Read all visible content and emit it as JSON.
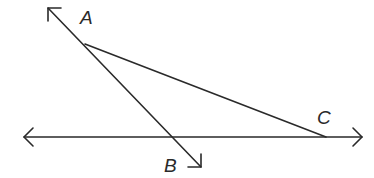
{
  "diagram": {
    "type": "geometry",
    "stroke_color": "#2a2a2a",
    "labels": {
      "A": "A",
      "B": "B",
      "C": "C"
    },
    "points": {
      "A": {
        "x": 85,
        "y": 44
      },
      "C": {
        "x": 326,
        "y": 137
      },
      "intersection": {
        "x": 172,
        "y": 137
      }
    },
    "lines": [
      {
        "name": "line-AB",
        "from": {
          "x": 48,
          "y": 8
        },
        "to": {
          "x": 201,
          "y": 167
        },
        "arrows": "both"
      },
      {
        "name": "horizontal-line",
        "from": {
          "x": 24,
          "y": 137
        },
        "to": {
          "x": 362,
          "y": 137
        },
        "arrows": "both"
      },
      {
        "name": "segment-AC",
        "from": {
          "x": 85,
          "y": 44
        },
        "to": {
          "x": 326,
          "y": 137
        },
        "arrows": "none"
      }
    ]
  }
}
